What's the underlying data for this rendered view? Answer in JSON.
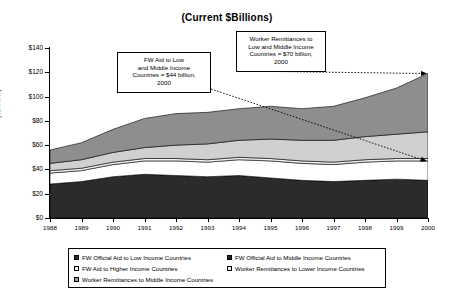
{
  "chart_data": {
    "type": "area",
    "title": "(Current $Billions)",
    "xlabel": "",
    "ylabel": "($Billions)",
    "ylim": [
      0,
      140
    ],
    "ytick_step": 20,
    "grid": false,
    "legend_position": "bottom",
    "x": [
      1988,
      1989,
      1990,
      1991,
      1992,
      1993,
      1994,
      1995,
      1996,
      1997,
      1998,
      1999,
      2000
    ],
    "ticklabels": {
      "y": [
        "$0",
        "$20",
        "$40",
        "$60",
        "$80",
        "$100",
        "$120",
        "$140"
      ],
      "x": [
        "1988",
        "1989",
        "1990",
        "1991",
        "1992",
        "1993",
        "1994",
        "1995",
        "1996",
        "1997",
        "1998",
        "1999",
        "2000"
      ]
    },
    "stacked": true,
    "series": [
      {
        "name": "FW Official Aid to Low Income Countries",
        "color": "#2b2b2b",
        "values": [
          28,
          30,
          34,
          36,
          35,
          34,
          35,
          33,
          31,
          30,
          31,
          32,
          31
        ]
      },
      {
        "name": "FW Official Aid to Middle Income Countries",
        "color": "#ffffff",
        "values": [
          9,
          9,
          10,
          11,
          12,
          12,
          13,
          14,
          14,
          14,
          15,
          15,
          16
        ]
      },
      {
        "name": "FW Aid to Higher Income Countries",
        "color": "#f2f2f2",
        "values": [
          2,
          2,
          2,
          2,
          2,
          2,
          2,
          2,
          2,
          2,
          2,
          2,
          2
        ]
      },
      {
        "name": "Worker Remittances to Lower Income Countries",
        "color": "#d0d0d0",
        "values": [
          6,
          7,
          8,
          9,
          11,
          13,
          14,
          16,
          17,
          18,
          19,
          20,
          22
        ]
      },
      {
        "name": "Worker Remittances to Middle Income Countries",
        "color": "#8e8e8e",
        "values": [
          11,
          14,
          19,
          24,
          26,
          26,
          26,
          27,
          26,
          28,
          32,
          38,
          48
        ]
      }
    ],
    "annotations": [
      {
        "id": "fw-aid-callout",
        "text": "FW Aid to Low and Middle  Income Countries = $44 billion, 2000",
        "lines": [
          "FW Aid to Low",
          "and Middle  Income",
          "Countries = $44 billion,",
          "2000"
        ],
        "arrow_to": {
          "x": 2000,
          "y": 47
        }
      },
      {
        "id": "remittances-callout",
        "text": "Worker Remittances to Low and Middle Income Countries = $70 billion, 2000",
        "lines": [
          "Worker Remittances to",
          "Low and Middle Income",
          "Countries = $70 billion,",
          "2000"
        ],
        "arrow_to": {
          "x": 2000,
          "y": 119
        }
      }
    ]
  },
  "legend": {
    "items": [
      {
        "label": "FW Official Aid to Low Income Countries",
        "color": "#2b2b2b"
      },
      {
        "label": "FW Official Aid to Middle Income Countries",
        "color": "#1f1f1f"
      },
      {
        "label": "FW Aid to Higher Income Countries",
        "color": "#ffffff"
      },
      {
        "label": "Worker Remittances to Lower Income Countries",
        "color": "#e8e8e8"
      },
      {
        "label": "Worker Remittances to Middle Income Countries",
        "color": "#9a9a9a"
      }
    ]
  }
}
